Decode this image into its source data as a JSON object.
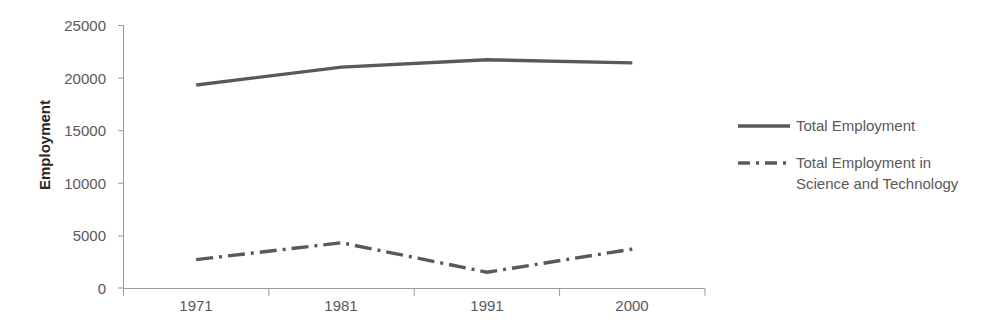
{
  "chart_data": {
    "type": "line",
    "title": "",
    "xlabel": "",
    "ylabel": "Employment",
    "categories": [
      "1971",
      "1981",
      "1991",
      "2000"
    ],
    "ylim": [
      0,
      25000
    ],
    "yticks": [
      0,
      5000,
      10000,
      15000,
      20000,
      25000
    ],
    "ytick_labels": [
      "0",
      "5000",
      "10000",
      "15000",
      "20000",
      "25000"
    ],
    "grid": false,
    "legend_position": "right",
    "series": [
      {
        "name": "Total Employment",
        "values": [
          19300,
          21000,
          21700,
          21400
        ],
        "style": "solid",
        "color": "#595959"
      },
      {
        "name": "Total Employment in Science and Technology",
        "values": [
          2700,
          4300,
          1500,
          3700
        ],
        "style": "dash-dot",
        "color": "#595959"
      }
    ]
  },
  "axis": {
    "y_title": "Employment",
    "y_tick_0": "0",
    "y_tick_1": "5000",
    "y_tick_2": "10000",
    "y_tick_3": "15000",
    "y_tick_4": "20000",
    "y_tick_5": "25000",
    "x_tick_0": "1971",
    "x_tick_1": "1981",
    "x_tick_2": "1991",
    "x_tick_3": "2000"
  },
  "legend": {
    "entry_1_label": "Total Employment",
    "entry_2_label_line1": "Total Employment in",
    "entry_2_label_line2": "Science and Technology"
  },
  "colors": {
    "series_line": "#595959",
    "axis_line": "#9a9a9a",
    "tick_text": "#595959",
    "title_text": "#262626",
    "background": "#ffffff"
  }
}
